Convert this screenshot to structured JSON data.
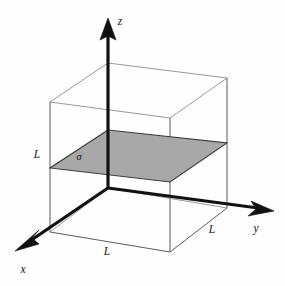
{
  "figure": {
    "background_color": "#fefefe",
    "axes": {
      "z": {
        "label": "z",
        "icon": "arrow-up-icon",
        "direction": "up",
        "origin": [
          108,
          188
        ],
        "tip": [
          108,
          20
        ],
        "label_pos": [
          120,
          22
        ]
      },
      "y": {
        "label": "y",
        "icon": "arrow-right-icon",
        "direction": "right",
        "origin": [
          108,
          188
        ],
        "tip": [
          272,
          210
        ],
        "label_pos": [
          256,
          229
        ]
      },
      "x": {
        "label": "x",
        "icon": "arrow-down-left-icon",
        "direction": "down-left",
        "origin": [
          108,
          188
        ],
        "tip": [
          16,
          250
        ],
        "label_pos": [
          23,
          270
        ]
      }
    },
    "cube": {
      "edge_color": "#5a5a5a",
      "light_edge_color": "#8d8d8d",
      "vertices": {
        "top_back": [
          108,
          63
        ],
        "top_left": [
          50,
          102
        ],
        "top_right": [
          227,
          78
        ],
        "top_front": [
          170,
          118
        ],
        "bottom_back": [
          108,
          188
        ],
        "bottom_left": [
          50,
          232
        ],
        "bottom_right": [
          227,
          208
        ],
        "bottom_front": [
          170,
          252
        ]
      }
    },
    "sheet": {
      "symbol": "σ",
      "symbol_pos": [
        79,
        158
      ],
      "fill_color": "#a8a8a8",
      "stroke_color": "#3a3a3a",
      "vertices": {
        "back": [
          108,
          130
        ],
        "left": [
          50,
          168
        ],
        "front": [
          170,
          182
        ],
        "right": [
          227,
          143
        ]
      }
    },
    "dimension_labels": [
      {
        "name": "left-height-label",
        "text": "L",
        "x": 37,
        "y": 155
      },
      {
        "name": "front-depth-label",
        "text": "L",
        "x": 107,
        "y": 252
      },
      {
        "name": "front-width-label",
        "text": "L",
        "x": 212,
        "y": 230
      }
    ]
  }
}
